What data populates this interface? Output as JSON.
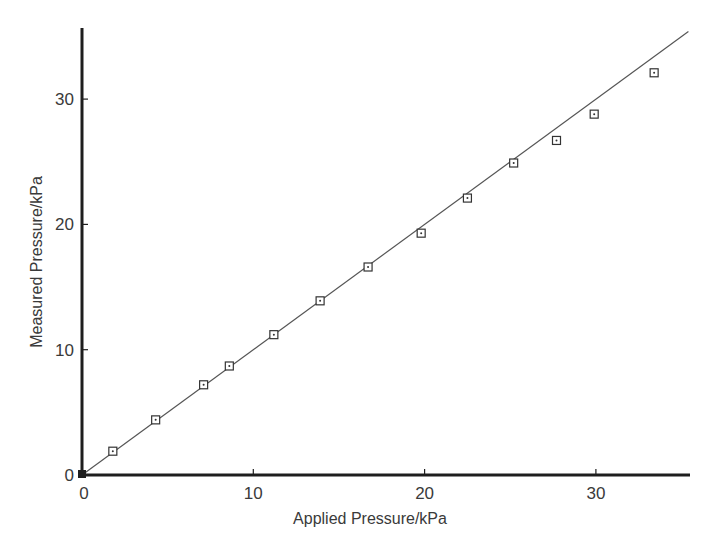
{
  "chart_data": {
    "type": "scatter",
    "title": "",
    "xlabel": "Applied Pressure/kPa",
    "ylabel": "Measured Pressure/kPa",
    "xlim": [
      0,
      35.5
    ],
    "ylim": [
      0,
      35.8
    ],
    "x_ticks": [
      0,
      10,
      20,
      30
    ],
    "y_ticks": [
      0,
      10,
      20,
      30
    ],
    "x_tick_labels": [
      "0",
      "10",
      "20",
      "30"
    ],
    "y_tick_labels": [
      "0",
      "10",
      "20",
      "30"
    ],
    "grid": false,
    "legend": null,
    "series": [
      {
        "name": "Measured",
        "marker": "square-dot",
        "x": [
          0,
          1.8,
          4.3,
          7.1,
          8.6,
          11.2,
          13.9,
          16.7,
          19.8,
          22.5,
          25.2,
          27.7,
          29.9,
          33.4
        ],
        "y": [
          0,
          1.9,
          4.4,
          7.2,
          8.7,
          11.2,
          13.9,
          16.6,
          19.3,
          22.1,
          24.9,
          26.7,
          28.8,
          32.1
        ]
      },
      {
        "name": "Ideal (y = x)",
        "type": "line",
        "x": [
          0,
          35.4
        ],
        "y": [
          0,
          35.4
        ]
      }
    ]
  },
  "colors": {
    "axis": "#1e1e1e",
    "line": "#555555",
    "marker": "#333333",
    "text": "#3a3a3a"
  }
}
